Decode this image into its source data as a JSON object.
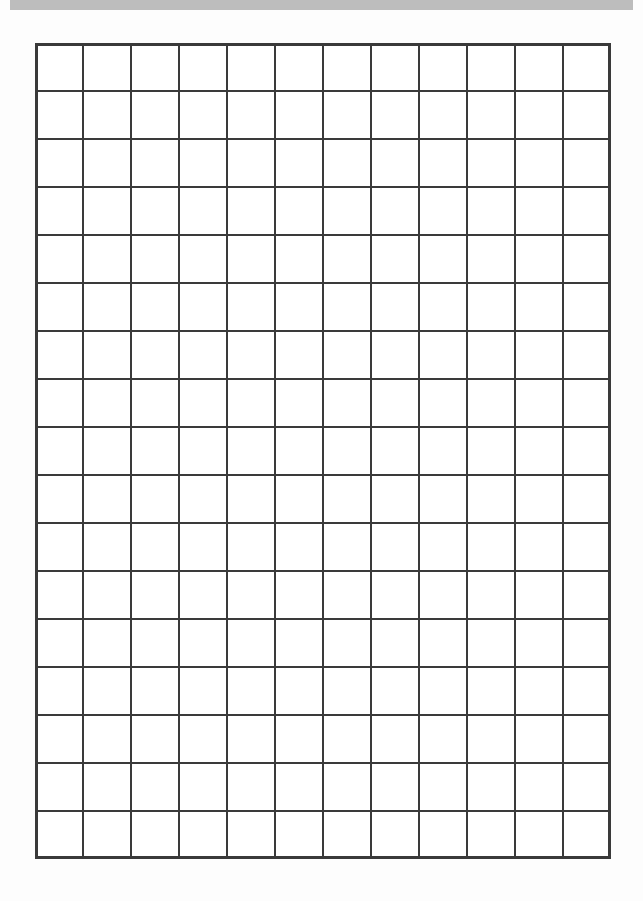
{
  "page": {
    "type": "graph-paper-worksheet",
    "background_color": "#fdfdfd"
  },
  "top_bar": {
    "color": "#bdbdbd"
  },
  "grid": {
    "columns": 12,
    "rows": 17,
    "cell_size_px": 48,
    "origin": {
      "x": 35,
      "y": 43
    },
    "line_color": "#3a3a3a",
    "inner_line_width": 2,
    "border_width": 3
  }
}
